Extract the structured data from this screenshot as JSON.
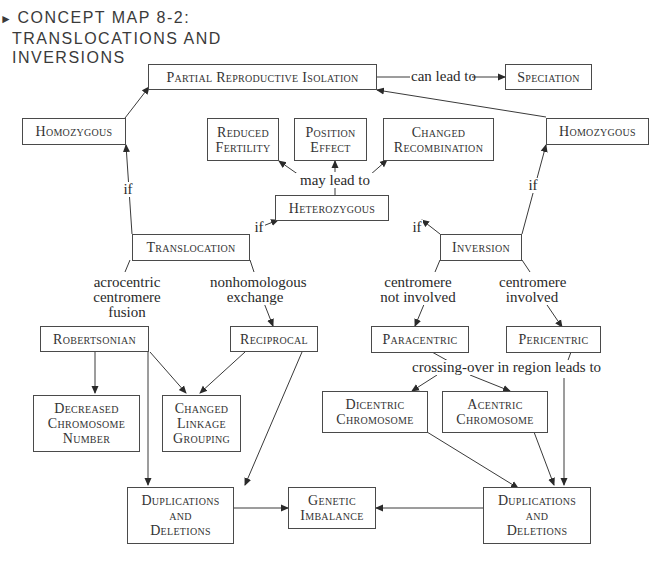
{
  "title": {
    "line1": "CONCEPT MAP 8-2:",
    "line2": "TRANSLOCATIONS AND",
    "line3": "INVERSIONS",
    "marker": "►"
  },
  "nodes": {
    "partial_isolation": {
      "lines": [
        "Partial Reproductive Isolation"
      ]
    },
    "speciation": {
      "lines": [
        "Speciation"
      ]
    },
    "homozygous_left": {
      "lines": [
        "Homozygous"
      ]
    },
    "homozygous_right": {
      "lines": [
        "Homozygous"
      ]
    },
    "reduced_fertility": {
      "lines": [
        "Reduced",
        "Fertility"
      ]
    },
    "position_effect": {
      "lines": [
        "Position",
        "Effect"
      ]
    },
    "changed_recombination": {
      "lines": [
        "Changed",
        "Recombination"
      ]
    },
    "heterozygous": {
      "lines": [
        "Heterozygous"
      ]
    },
    "translocation": {
      "lines": [
        "Translocation"
      ]
    },
    "inversion": {
      "lines": [
        "Inversion"
      ]
    },
    "robertsonian": {
      "lines": [
        "Robertsonian"
      ]
    },
    "reciprocal": {
      "lines": [
        "Reciprocal"
      ]
    },
    "paracentric": {
      "lines": [
        "Paracentric"
      ]
    },
    "pericentric": {
      "lines": [
        "Pericentric"
      ]
    },
    "decreased_chromosome_number": {
      "lines": [
        "Decreased",
        "Chromosome",
        "Number"
      ]
    },
    "changed_linkage_grouping": {
      "lines": [
        "Changed",
        "Linkage",
        "Grouping"
      ]
    },
    "dicentric_chromosome": {
      "lines": [
        "Dicentric",
        "Chromosome"
      ]
    },
    "acentric_chromosome": {
      "lines": [
        "Acentric",
        "Chromosome"
      ]
    },
    "dup_del_left": {
      "lines": [
        "Duplications",
        "and",
        "Deletions"
      ]
    },
    "genetic_imbalance": {
      "lines": [
        "Genetic",
        "Imbalance"
      ]
    },
    "dup_del_right": {
      "lines": [
        "Duplications",
        "and",
        "Deletions"
      ]
    }
  },
  "link_labels": {
    "can_lead_to": [
      "can lead to"
    ],
    "may_lead_to": [
      "may lead to"
    ],
    "if_left_homo": [
      "if"
    ],
    "if_right_homo": [
      "if"
    ],
    "if_trans_het": [
      "if"
    ],
    "if_inv_het": [
      "if"
    ],
    "acrocentric": [
      "acrocentric",
      "centromere",
      "fusion"
    ],
    "nonhomologous": [
      "nonhomologous",
      "exchange"
    ],
    "centromere_not_involved": [
      "centromere",
      "not involved"
    ],
    "centromere_involved": [
      "centromere",
      "involved"
    ],
    "crossing_over": [
      "crossing-over in region leads to"
    ]
  },
  "colors": {
    "line": "#3a3a3a",
    "border": "#4a4a4a",
    "text": "#2a2a2a",
    "background": "#ffffff"
  }
}
